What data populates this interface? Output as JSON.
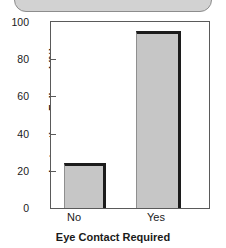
{
  "chart_data": {
    "type": "bar",
    "title": "",
    "xlabel": "Eye Contact Required",
    "ylabel": "Instructions Followed (%)",
    "categories": [
      "No",
      "Yes"
    ],
    "values": [
      24,
      95
    ],
    "ylim": [
      0,
      100
    ],
    "yticks": [
      0,
      20,
      40,
      60,
      80,
      100
    ],
    "ytick_labels": [
      "0",
      "20",
      "40",
      "60",
      "80",
      "100"
    ],
    "grid": false,
    "legend": null,
    "series": [
      {
        "name": "Instructions Followed (%)",
        "values": [
          24,
          95
        ]
      }
    ],
    "bar_fill_color": "#c6c6c6",
    "bar_edge_color": "#1c1c1c",
    "axis_color": "#5a5a5a"
  },
  "decor": {
    "top_panel_name": "rounded-panel"
  }
}
